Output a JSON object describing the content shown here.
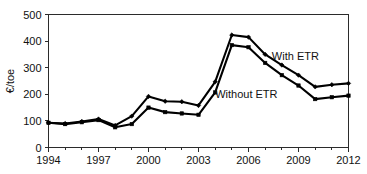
{
  "chart_data": {
    "type": "line",
    "title": "",
    "xlabel": "",
    "ylabel": "€/toe",
    "xlim": [
      1994,
      2012
    ],
    "ylim": [
      0,
      500
    ],
    "xticks": [
      1994,
      1997,
      2000,
      2003,
      2006,
      2009,
      2012
    ],
    "xticklabels": [
      "1994",
      "1997",
      "2000",
      "2003",
      "2006",
      "2009",
      "2012"
    ],
    "yticks": [
      0,
      100,
      200,
      300,
      400,
      500
    ],
    "yticklabels": [
      "0",
      "100",
      "200",
      "300",
      "400",
      "500"
    ],
    "minor_xticks": [
      1995,
      1996,
      1998,
      1999,
      2001,
      2002,
      2004,
      2005,
      2007,
      2008,
      2010,
      2011
    ],
    "grid": false,
    "legend_position": "inline-annotation",
    "x": [
      1994,
      1995,
      1996,
      1997,
      1998,
      1999,
      2000,
      2001,
      2002,
      2003,
      2004,
      2005,
      2006,
      2007,
      2008,
      2009,
      2010,
      2011,
      2012
    ],
    "series": [
      {
        "name": "With ETR",
        "label": "With ETR",
        "marker": "diamond",
        "color": "#000000",
        "values": [
          93,
          90,
          98,
          107,
          83,
          118,
          192,
          174,
          172,
          158,
          247,
          423,
          415,
          350,
          310,
          272,
          228,
          236,
          241
        ]
      },
      {
        "name": "Without ETR",
        "label": "Without ETR",
        "marker": "square",
        "color": "#000000",
        "values": [
          93,
          88,
          95,
          103,
          76,
          88,
          150,
          133,
          128,
          123,
          207,
          385,
          377,
          318,
          272,
          233,
          182,
          189,
          195
        ]
      }
    ],
    "annotations": [
      {
        "text": "With ETR",
        "x": 2007.4,
        "y": 330
      },
      {
        "text": "Without ETR",
        "x": 2004.0,
        "y": 185
      }
    ]
  },
  "axis": {
    "y_title": "€/toe"
  }
}
